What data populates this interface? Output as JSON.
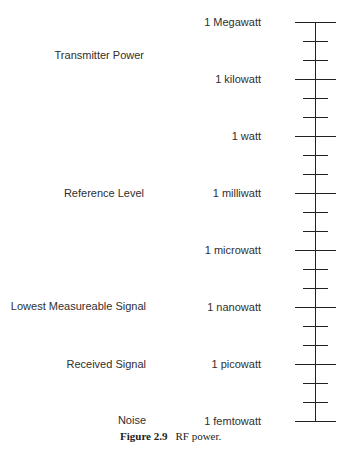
{
  "diagram": {
    "type": "logarithmic power scale",
    "scale_labels": [
      {
        "label": "1 Megawatt",
        "y": 22
      },
      {
        "label": "1 kilowatt",
        "y": 79
      },
      {
        "label": "1 watt",
        "y": 136
      },
      {
        "label": "1 milliwatt",
        "y": 193
      },
      {
        "label": "1 microwatt",
        "y": 250
      },
      {
        "label": "1 nanowatt",
        "y": 307
      },
      {
        "label": "1 picowatt",
        "y": 364
      },
      {
        "label": "1 femtowatt",
        "y": 421
      }
    ],
    "category_labels": [
      {
        "label": "Transmitter Power",
        "y": 55
      },
      {
        "label": "Reference Level",
        "y": 193
      },
      {
        "label": "Lowest Measureable Signal",
        "y": 306
      },
      {
        "label": "Received Signal",
        "y": 364
      },
      {
        "label": "Noise",
        "y": 420
      }
    ],
    "minor_ticks_per_interval": 2
  },
  "caption": {
    "figure_number": "Figure 2.9",
    "text": "RF power."
  }
}
